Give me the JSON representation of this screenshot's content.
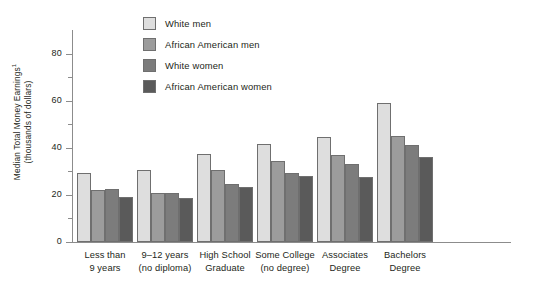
{
  "chart_data": {
    "type": "bar",
    "title": "",
    "xlabel": "",
    "ylabel": "Median Total Money Earnings",
    "ylabel_line2": "(thousands of dollars)",
    "ylabel_superscript": "1",
    "ylim": [
      0,
      90
    ],
    "ytick_values": [
      0,
      20,
      40,
      60,
      80
    ],
    "ytick_labels": [
      "0",
      "20",
      "40",
      "60",
      "80"
    ],
    "yminor_values": [
      10,
      30,
      50,
      70
    ],
    "grid": false,
    "legend_position": "top-center",
    "categories": [
      "Less than\n9 years",
      "9–12 years\n(no diploma)",
      "High School\nGraduate",
      "Some College\n(no degree)",
      "Associates\nDegree",
      "Bachelors\nDegree"
    ],
    "category_lines": [
      [
        "Less than",
        "9 years"
      ],
      [
        "9–12 years",
        "(no diploma)"
      ],
      [
        "High School",
        "Graduate"
      ],
      [
        "Some College",
        "(no degree)"
      ],
      [
        "Associates",
        "Degree"
      ],
      [
        "Bachelors",
        "Degree"
      ]
    ],
    "series": [
      {
        "name": "White men",
        "color": "#dedede",
        "values": [
          29.5,
          30.5,
          37.5,
          41.5,
          44.5,
          59.0
        ]
      },
      {
        "name": "African American men",
        "color": "#9c9c9c",
        "values": [
          22.0,
          21.0,
          30.5,
          34.5,
          37.0,
          45.0
        ]
      },
      {
        "name": "White women",
        "color": "#7c7c7c",
        "values": [
          22.5,
          21.0,
          24.5,
          29.5,
          33.0,
          41.0
        ]
      },
      {
        "name": "African American women",
        "color": "#5a5a5a",
        "values": [
          19.0,
          18.5,
          23.5,
          28.0,
          27.5,
          36.0
        ]
      }
    ]
  },
  "legend": {
    "items": [
      {
        "label": "White men",
        "color": "#dedede"
      },
      {
        "label": "African American men",
        "color": "#9c9c9c"
      },
      {
        "label": "White women",
        "color": "#7c7c7c"
      },
      {
        "label": "African American women",
        "color": "#5a5a5a"
      }
    ]
  },
  "axis": {
    "line_color": "#8c8c8c",
    "bar_border_color": "#6f6f6f",
    "text_color": "#231f20"
  }
}
